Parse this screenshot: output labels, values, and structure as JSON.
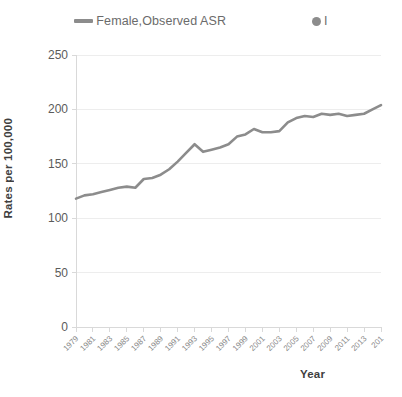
{
  "legend": {
    "entries": [
      {
        "label": "Female,Observed ASR",
        "marker": "line",
        "color": "#8c8c8c"
      },
      {
        "label": "I",
        "marker": "circle",
        "color": "#8c8c8c"
      }
    ]
  },
  "axis_titles": {
    "y": "Rates per 100,000",
    "x": "Year"
  },
  "chart_data": {
    "type": "line",
    "title": "",
    "xlabel": "Year",
    "ylabel": "Rates per 100,000",
    "ylim": [
      0,
      250
    ],
    "yticks": [
      0,
      50,
      100,
      150,
      200,
      250
    ],
    "ytick_labels": [
      "0",
      "50",
      "100",
      "150",
      "200",
      "250"
    ],
    "xlim": [
      1979,
      2015
    ],
    "xticks": [
      1979,
      1981,
      1983,
      1985,
      1987,
      1989,
      1991,
      1993,
      1995,
      1997,
      1999,
      2001,
      2003,
      2005,
      2007,
      2009,
      2011,
      2013,
      2015
    ],
    "xtick_labels": [
      "1979",
      "1981",
      "1983",
      "1985",
      "1987",
      "1989",
      "1991",
      "1993",
      "1995",
      "1997",
      "1999",
      "2001",
      "2003",
      "2005",
      "2007",
      "2009",
      "2011",
      "2013",
      "201"
    ],
    "grid": true,
    "legend_position": "top",
    "x": [
      1979,
      1980,
      1981,
      1982,
      1983,
      1984,
      1985,
      1986,
      1987,
      1988,
      1989,
      1990,
      1991,
      1992,
      1993,
      1994,
      1995,
      1996,
      1997,
      1998,
      1999,
      2000,
      2001,
      2002,
      2003,
      2004,
      2005,
      2006,
      2007,
      2008,
      2009,
      2010,
      2011,
      2012,
      2013,
      2014,
      2015
    ],
    "series": [
      {
        "name": "Female,Observed ASR",
        "color": "#8c8c8c",
        "marker": "none",
        "values": [
          118,
          121,
          122,
          124,
          126,
          128,
          129,
          128,
          136,
          137,
          140,
          145,
          152,
          160,
          168,
          161,
          163,
          165,
          168,
          175,
          177,
          182,
          179,
          179,
          180,
          188,
          192,
          194,
          193,
          196,
          195,
          196,
          194,
          195,
          196,
          200,
          204
        ]
      }
    ]
  }
}
